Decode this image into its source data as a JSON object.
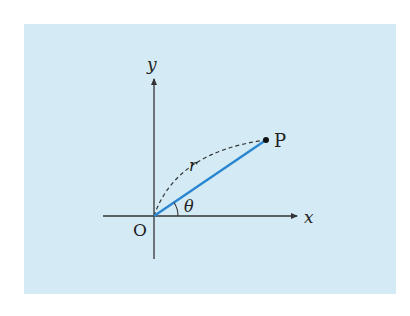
{
  "figure": {
    "background_color": "#d4ebf5",
    "axis_color": "#333333",
    "segment_color": "#2a86d0",
    "labels": {
      "y_axis": "y",
      "x_axis": "x",
      "origin": "O",
      "point": "P",
      "radius": "r",
      "angle": "θ"
    },
    "elements": [
      {
        "kind": "axis",
        "name": "x-axis",
        "from": [
          103,
          216
        ],
        "to": [
          298,
          216
        ],
        "arrow": true
      },
      {
        "kind": "axis",
        "name": "y-axis",
        "from": [
          154,
          259
        ],
        "to": [
          154,
          78
        ],
        "arrow": true
      },
      {
        "kind": "segment",
        "name": "OP",
        "from": [
          154,
          216
        ],
        "to": [
          266,
          140
        ],
        "style": "solid blue"
      },
      {
        "kind": "arc",
        "name": "r-arc",
        "from": [
          154,
          216
        ],
        "to": [
          266,
          140
        ],
        "style": "dashed"
      },
      {
        "kind": "angle-arc",
        "name": "theta",
        "vertex": [
          154,
          216
        ]
      },
      {
        "kind": "point",
        "name": "P",
        "at": [
          266,
          140
        ]
      }
    ]
  }
}
